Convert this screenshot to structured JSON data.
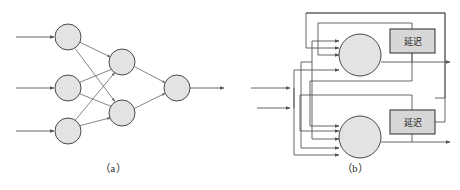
{
  "figure": {
    "type": "diagram",
    "background_color": "#ffffff",
    "neuron_fill_color": "#e3e3e3",
    "neuron_stroke_color": "#4a4a4a",
    "wire_color": "#555555",
    "delay_box_fill_color": "#d6d6d6",
    "delay_box_stroke_color": "#3d3d3d",
    "panels": [
      {
        "id": "panel-a",
        "caption": "（a）",
        "caption_x": 113,
        "caption_y": 172,
        "kind": "feedforward-network",
        "layers": [
          {
            "name": "input-layer",
            "neurons": [
              {
                "id": "in-1",
                "cx": 68,
                "cy": 37,
                "r": 13
              },
              {
                "id": "in-2",
                "cx": 68,
                "cy": 88,
                "r": 13
              },
              {
                "id": "in-3",
                "cx": 68,
                "cy": 131,
                "r": 13
              }
            ]
          },
          {
            "name": "hidden-layer",
            "neurons": [
              {
                "id": "hid-1",
                "cx": 122,
                "cy": 62,
                "r": 13
              },
              {
                "id": "hid-2",
                "cx": 122,
                "cy": 113,
                "r": 13
              }
            ]
          },
          {
            "name": "output-layer",
            "neurons": [
              {
                "id": "out-1",
                "cx": 177,
                "cy": 88,
                "r": 13
              }
            ]
          }
        ],
        "input_arrows": [
          {
            "id": "input-arrow-1",
            "x1": 16,
            "y1": 37,
            "x2": 54,
            "y2": 37
          },
          {
            "id": "input-arrow-2",
            "x1": 16,
            "y1": 88,
            "x2": 54,
            "y2": 88
          },
          {
            "id": "input-arrow-3",
            "x1": 16,
            "y1": 131,
            "x2": 54,
            "y2": 131
          }
        ],
        "output_arrows": [
          {
            "id": "output-arrow-1",
            "x1": 190,
            "y1": 88,
            "x2": 224,
            "y2": 88
          }
        ],
        "synapses": [
          {
            "id": "syn-in1-hid1",
            "from": "in-1",
            "to": "hid-1"
          },
          {
            "id": "syn-in1-hid2",
            "from": "in-1",
            "to": "hid-2"
          },
          {
            "id": "syn-in2-hid1",
            "from": "in-2",
            "to": "hid-1"
          },
          {
            "id": "syn-in2-hid2",
            "from": "in-2",
            "to": "hid-2"
          },
          {
            "id": "syn-in3-hid1",
            "from": "in-3",
            "to": "hid-1"
          },
          {
            "id": "syn-in3-hid2",
            "from": "in-3",
            "to": "hid-2"
          },
          {
            "id": "syn-hid1-out1",
            "from": "hid-1",
            "to": "out-1"
          },
          {
            "id": "syn-hid2-out1",
            "from": "hid-2",
            "to": "out-1"
          }
        ]
      },
      {
        "id": "panel-b",
        "caption": "（b）",
        "caption_x": 355,
        "caption_y": 172,
        "kind": "recurrent-network",
        "neurons": [
          {
            "id": "rec-neuron-top",
            "cx": 360,
            "cy": 55,
            "r": 21
          },
          {
            "id": "rec-neuron-bottom",
            "cx": 360,
            "cy": 137,
            "r": 21
          }
        ],
        "delay_blocks": [
          {
            "id": "delay-top",
            "label": "延迟",
            "x": 390,
            "y": 29,
            "width": 45,
            "height": 24
          },
          {
            "id": "delay-bottom",
            "label": "延迟",
            "x": 390,
            "y": 110,
            "width": 45,
            "height": 24
          }
        ],
        "external_inputs": [
          {
            "id": "ext-input-arrow-1",
            "x1": 251,
            "y1": 88,
            "x2": 290,
            "y2": 88
          },
          {
            "id": "ext-input-arrow-2",
            "x1": 257,
            "y1": 108,
            "x2": 290,
            "y2": 108
          }
        ],
        "outputs": [
          {
            "id": "rec-output-arrow-top",
            "x1": 381,
            "y1": 62,
            "x2": 450,
            "y2": 62
          },
          {
            "id": "rec-output-arrow-bottom",
            "x1": 381,
            "y1": 142,
            "x2": 450,
            "y2": 142
          }
        ],
        "neuron_input_counts": {
          "top": 4,
          "bottom": 4
        }
      }
    ]
  }
}
